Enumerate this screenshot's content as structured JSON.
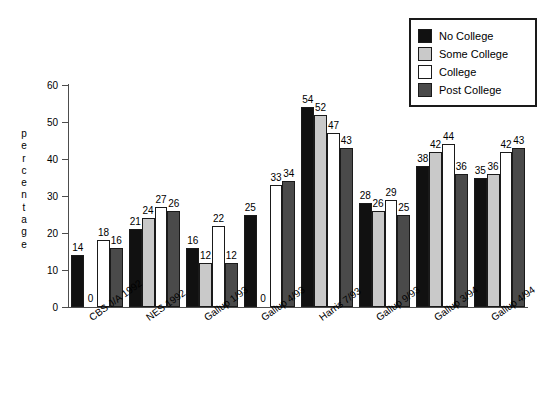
{
  "chart_data": {
    "type": "bar",
    "title": "",
    "subtitle": "",
    "xlabel": "",
    "ylabel": "percentage",
    "ylim": [
      0,
      60
    ],
    "yticks": [
      0,
      10,
      20,
      30,
      40,
      50,
      60
    ],
    "grid": false,
    "legend_position": "top-right",
    "categories": [
      "CBS J/A 1992",
      "NES 1992",
      "Gallup 1/93",
      "Gallup 4/93",
      "Harris 7/93",
      "Gallup 9/93",
      "Gallup 3/94",
      "Gallup 4/94"
    ],
    "series": [
      {
        "name": "No College",
        "color": "#111111",
        "values": [
          14,
          21,
          16,
          25,
          54,
          28,
          38,
          35
        ]
      },
      {
        "name": "Some College",
        "color": "#c9c9c9",
        "values": [
          0,
          24,
          12,
          0,
          52,
          26,
          42,
          36
        ]
      },
      {
        "name": "College",
        "color": "#ffffff",
        "values": [
          18,
          27,
          22,
          33,
          47,
          29,
          44,
          42
        ]
      },
      {
        "name": "Post College",
        "color": "#4a4a4a",
        "values": [
          16,
          26,
          12,
          34,
          43,
          25,
          36,
          43
        ]
      }
    ]
  },
  "legend": {
    "items": [
      {
        "label": "No College",
        "color": "#111111"
      },
      {
        "label": "Some College",
        "color": "#c9c9c9"
      },
      {
        "label": "College",
        "color": "#ffffff"
      },
      {
        "label": "Post College",
        "color": "#4a4a4a"
      }
    ]
  },
  "axis": {
    "y_title": "percentage",
    "y_tick_labels": [
      "60",
      "50",
      "40",
      "30",
      "20",
      "10",
      "0"
    ]
  }
}
